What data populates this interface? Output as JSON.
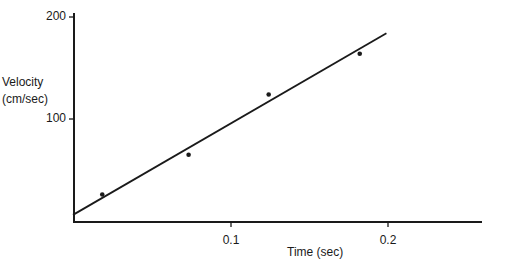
{
  "chart_data": {
    "type": "scatter",
    "title": "",
    "xlabel": "Time (sec)",
    "ylabel": "Velocity (cm/sec)",
    "ylabel_lines": [
      "Velocity",
      "(cm/sec)"
    ],
    "xlim": [
      0,
      0.26
    ],
    "ylim": [
      0,
      205
    ],
    "x_ticks": [
      0.1,
      0.2
    ],
    "x_tick_labels": [
      "0.1",
      "0.2"
    ],
    "y_ticks": [
      100,
      200
    ],
    "y_tick_labels": [
      "100",
      "200"
    ],
    "grid": false,
    "legend": null,
    "series": [
      {
        "name": "Measured velocity",
        "kind": "points",
        "x": [
          0.018,
          0.073,
          0.124,
          0.182
        ],
        "y": [
          26,
          65,
          124,
          164
        ]
      },
      {
        "name": "Best-fit line",
        "kind": "line",
        "x": [
          0.0,
          0.199
        ],
        "y": [
          6,
          184
        ]
      }
    ]
  },
  "layout": {
    "origin_px": [
      74,
      221
    ],
    "x_px_per_unit": 1570,
    "y_px_per_unit": 1.02,
    "x_axis_end_px": 482,
    "y_axis_top_px": 13,
    "ink_color": "#1a1a1a"
  }
}
